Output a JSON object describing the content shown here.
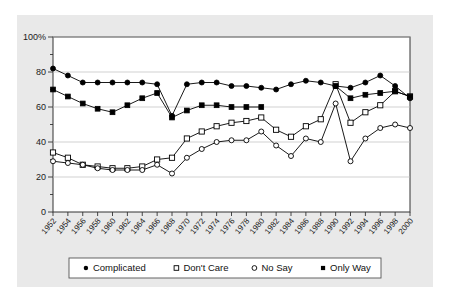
{
  "chart_data": {
    "type": "line",
    "title": "",
    "xlabel": "",
    "ylabel": "",
    "ylim": [
      0,
      100
    ],
    "yticks": [
      0,
      20,
      40,
      60,
      80,
      100
    ],
    "ytick_labels": [
      "0",
      "20",
      "40",
      "60",
      "80",
      "100%"
    ],
    "grid": true,
    "grid_axis": "y",
    "legend_position": "bottom",
    "x": [
      1952,
      1954,
      1956,
      1958,
      1960,
      1962,
      1964,
      1966,
      1968,
      1970,
      1972,
      1974,
      1976,
      1978,
      1980,
      1982,
      1984,
      1986,
      1988,
      1990,
      1992,
      1994,
      1996,
      1998,
      2000
    ],
    "xtick_labels": [
      "1952",
      "1954",
      "1956",
      "1958",
      "1960",
      "1962",
      "1964",
      "1966",
      "1968",
      "1970",
      "1972",
      "1974",
      "1976",
      "1978",
      "1980",
      "1982",
      "1984",
      "1986",
      "1988",
      "1990",
      "1992",
      "1994",
      "1996",
      "1998",
      "2000"
    ],
    "series": [
      {
        "name": "Complicated",
        "marker": "filled-circle",
        "color": "#000000",
        "values": [
          82,
          78,
          74,
          74,
          74,
          74,
          74,
          73,
          55,
          73,
          74,
          74,
          72,
          72,
          71,
          70,
          73,
          75,
          74,
          72,
          71,
          74,
          78,
          72,
          65
        ]
      },
      {
        "name": "Don't Care",
        "marker": "open-square",
        "color": "#000000",
        "values": [
          34,
          31,
          27,
          26,
          25,
          25,
          26,
          30,
          31,
          42,
          46,
          49,
          51,
          52,
          54,
          47,
          43,
          49,
          53,
          73,
          51,
          57,
          61,
          69,
          66
        ]
      },
      {
        "name": "No Say",
        "marker": "open-circle",
        "color": "#000000",
        "values": [
          29,
          28,
          27,
          25,
          24,
          24,
          24,
          27,
          22,
          31,
          36,
          40,
          41,
          41,
          46,
          38,
          32,
          42,
          40,
          62,
          29,
          42,
          48,
          50,
          48
        ]
      },
      {
        "name": "Only Way",
        "marker": "filled-square",
        "color": "#000000",
        "values": [
          70,
          66,
          62,
          59,
          57,
          61,
          65,
          68,
          54,
          58,
          61,
          61,
          60,
          60,
          60,
          null,
          null,
          null,
          null,
          72,
          65,
          67,
          68,
          69,
          66
        ]
      }
    ]
  },
  "legend": {
    "items": [
      {
        "label": "Complicated",
        "marker": "filled-circle"
      },
      {
        "label": "Don't Care",
        "marker": "open-square"
      },
      {
        "label": "No Say",
        "marker": "open-circle"
      },
      {
        "label": "Only Way",
        "marker": "filled-square"
      }
    ]
  },
  "colors": {
    "panel_background": "#e9e9e9",
    "plot_background": "#ffffff",
    "axis": "#333333",
    "grid": "#bdbdbd",
    "series": "#000000",
    "legend_border": "#555555"
  }
}
